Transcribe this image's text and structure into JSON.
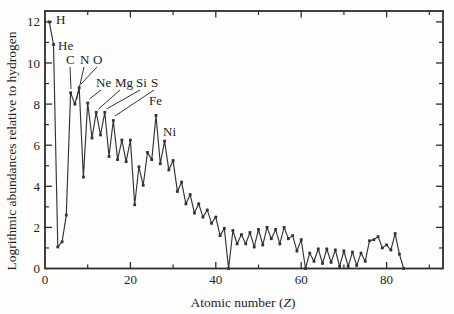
{
  "figure": {
    "background": "#fdfdfb",
    "ink": "#333333",
    "frame_color": "#2d2d2d"
  },
  "chart_data": {
    "type": "line",
    "title": "",
    "xlabel": "Atomic number (Z)",
    "ylabel": "Logrithmic abundances relative to hydrogen",
    "xlim": [
      0,
      93.5
    ],
    "ylim": [
      0,
      12.5
    ],
    "grid": false,
    "legend": "none",
    "x_major_ticks": [
      20,
      40,
      60,
      80
    ],
    "x_minor_ticks": [
      10,
      30,
      50,
      70,
      90
    ],
    "x_tick_labels": [
      {
        "value": 0,
        "label": "0"
      },
      {
        "value": 20,
        "label": "20"
      },
      {
        "value": 40,
        "label": "40"
      },
      {
        "value": 60,
        "label": "60"
      },
      {
        "value": 80,
        "label": "80"
      }
    ],
    "y_major_ticks": [
      2,
      4,
      6,
      8,
      10,
      12
    ],
    "y_minor_ticks": [
      1,
      3,
      5,
      7,
      9,
      11
    ],
    "y_tick_labels": [
      {
        "value": 0,
        "label": "0"
      },
      {
        "value": 2,
        "label": "2"
      },
      {
        "value": 4,
        "label": "4"
      },
      {
        "value": 6,
        "label": "6"
      },
      {
        "value": 8,
        "label": "8"
      },
      {
        "value": 10,
        "label": "10"
      },
      {
        "value": 12,
        "label": "12"
      }
    ],
    "series": [
      {
        "name": "logarithmic-abundance-vs-atomic-number",
        "marker": "square",
        "points": [
          [
            1,
            12.0
          ],
          [
            2,
            10.9
          ],
          [
            3,
            1.05
          ],
          [
            4,
            1.3
          ],
          [
            5,
            2.6
          ],
          [
            6,
            8.55
          ],
          [
            7,
            8.0
          ],
          [
            8,
            8.8
          ],
          [
            9,
            4.45
          ],
          [
            10,
            8.05
          ],
          [
            11,
            6.35
          ],
          [
            12,
            7.6
          ],
          [
            13,
            6.5
          ],
          [
            14,
            7.6
          ],
          [
            15,
            5.45
          ],
          [
            16,
            7.2
          ],
          [
            17,
            5.3
          ],
          [
            18,
            6.25
          ],
          [
            19,
            5.2
          ],
          [
            20,
            6.25
          ],
          [
            21,
            3.1
          ],
          [
            22,
            4.95
          ],
          [
            23,
            4.05
          ],
          [
            24,
            5.65
          ],
          [
            25,
            5.3
          ],
          [
            26,
            7.45
          ],
          [
            27,
            5.1
          ],
          [
            28,
            6.2
          ],
          [
            29,
            4.8
          ],
          [
            30,
            5.25
          ],
          [
            31,
            3.75
          ],
          [
            32,
            4.2
          ],
          [
            33,
            3.15
          ],
          [
            34,
            3.6
          ],
          [
            35,
            2.7
          ],
          [
            36,
            3.15
          ],
          [
            37,
            2.5
          ],
          [
            38,
            2.85
          ],
          [
            39,
            2.2
          ],
          [
            40,
            2.5
          ],
          [
            41,
            1.6
          ],
          [
            42,
            1.95
          ],
          [
            43,
            0
          ],
          [
            44,
            1.85
          ],
          [
            45,
            1.2
          ],
          [
            46,
            1.65
          ],
          [
            47,
            1.2
          ],
          [
            48,
            1.75
          ],
          [
            49,
            1.05
          ],
          [
            50,
            1.9
          ],
          [
            51,
            1.15
          ],
          [
            52,
            2.0
          ],
          [
            53,
            1.45
          ],
          [
            54,
            1.9
          ],
          [
            55,
            1.2
          ],
          [
            56,
            2.0
          ],
          [
            57,
            1.45
          ],
          [
            58,
            1.6
          ],
          [
            59,
            0.85
          ],
          [
            60,
            1.4
          ],
          [
            61,
            0
          ],
          [
            62,
            0.75
          ],
          [
            63,
            0.35
          ],
          [
            64,
            0.95
          ],
          [
            65,
            0.25
          ],
          [
            66,
            0.95
          ],
          [
            67,
            0.3
          ],
          [
            68,
            0.9
          ],
          [
            69,
            0.1
          ],
          [
            70,
            0.85
          ],
          [
            71,
            0.1
          ],
          [
            72,
            0.8
          ],
          [
            73,
            0.15
          ],
          [
            74,
            0.75
          ],
          [
            75,
            0.35
          ],
          [
            76,
            1.35
          ],
          [
            77,
            1.4
          ],
          [
            78,
            1.55
          ],
          [
            79,
            1.0
          ],
          [
            80,
            1.15
          ],
          [
            81,
            0.9
          ],
          [
            82,
            1.7
          ],
          [
            83,
            0.7
          ],
          [
            84,
            0
          ]
        ]
      }
    ],
    "annotations": [
      {
        "label": "H",
        "tx": 56,
        "ty": 24
      },
      {
        "label": "He",
        "tx": 58,
        "ty": 50
      },
      {
        "label": "C",
        "tx": 66,
        "ty": 64,
        "leader": [
          70,
          67,
          71,
          89
        ]
      },
      {
        "label": "N",
        "tx": 80,
        "ty": 64,
        "leader": [
          84,
          67,
          76.5,
          100
        ]
      },
      {
        "label": "O",
        "tx": 93,
        "ty": 64,
        "leader": [
          97,
          67,
          81,
          84
        ]
      },
      {
        "label": "Ne",
        "tx": 96,
        "ty": 87,
        "leader": [
          101,
          90,
          89.5,
          99
        ]
      },
      {
        "label": "Mg",
        "tx": 115,
        "ty": 87,
        "leader": [
          120,
          90,
          98.5,
          109
        ]
      },
      {
        "label": "Si",
        "tx": 136,
        "ty": 87,
        "leader": [
          140,
          90,
          106.5,
          109
        ]
      },
      {
        "label": "S",
        "tx": 151,
        "ty": 87,
        "leader": [
          154,
          90,
          115,
          116
        ]
      },
      {
        "label": "Fe",
        "tx": 149,
        "ty": 105
      },
      {
        "label": "Ni",
        "tx": 163,
        "ty": 136
      }
    ]
  },
  "x_axis": {
    "title_prefix": "Atomic number (",
    "title_var": "Z",
    "title_suffix": ")"
  },
  "y_axis": {
    "title": "Logrithmic abundances relative to hydrogen"
  }
}
